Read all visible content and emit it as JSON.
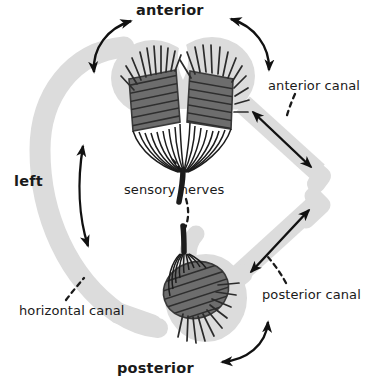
{
  "figure": {
    "background_color": "#ffffff",
    "width": 368,
    "height": 385
  },
  "palette": {
    "canal_fill": "#d9d9d9",
    "canal_fill_light": "#e2e2e2",
    "cupula_dark": "#4a4a4a",
    "hair_line": "#2b2b2b",
    "nerve_line": "#1c1c1c",
    "arrow": "#111111",
    "leader_dash": "#1a1a1a",
    "text": "#1a1a1a"
  },
  "orientation_labels": [
    {
      "id": "anterior",
      "text": "anterior",
      "weight": "bold"
    },
    {
      "id": "posterior",
      "text": "posterior",
      "weight": "bold"
    },
    {
      "id": "left",
      "text": "left",
      "weight": "bold"
    }
  ],
  "structure_labels": [
    {
      "id": "anterior-canal",
      "text": "anterior canal",
      "weight": "normal",
      "has_leader": true
    },
    {
      "id": "posterior-canal",
      "text": "posterior canal",
      "weight": "normal",
      "has_leader": true
    },
    {
      "id": "horizontal-canal",
      "text": "horizontal canal",
      "weight": "normal",
      "has_leader": true
    },
    {
      "id": "sensory-nerves",
      "text": "sensory nerves",
      "weight": "normal",
      "has_leader": true
    }
  ],
  "labels": {
    "anterior": "anterior",
    "posterior": "posterior",
    "left": "left",
    "anterior_canal": "anterior canal",
    "posterior_canal": "posterior canal",
    "horizontal_canal": "horizontal canal",
    "sensory_nerves": "sensory nerves"
  },
  "anatomy": {
    "ampullae": [
      {
        "id": "anterior-left-ampulla",
        "position": "upper-left"
      },
      {
        "id": "anterior-right-ampulla",
        "position": "upper-right"
      },
      {
        "id": "posterior-ampulla",
        "position": "lower-center"
      }
    ],
    "canals": [
      {
        "id": "horizontal-canal-body",
        "shape": "c-arc",
        "side": "left"
      },
      {
        "id": "anterior-canal-body",
        "shape": "diagonal",
        "side": "upper-right"
      },
      {
        "id": "posterior-canal-body",
        "shape": "diagonal",
        "side": "lower-right"
      }
    ],
    "nerve_bundles": [
      {
        "id": "upper-nerve-trunk"
      },
      {
        "id": "lower-nerve-trunk"
      }
    ]
  },
  "arrows": {
    "curved": [
      {
        "id": "arrow-curved-top-left",
        "style": "double-headed"
      },
      {
        "id": "arrow-curved-top-right",
        "style": "double-headed"
      },
      {
        "id": "arrow-curved-bottom",
        "style": "double-headed"
      }
    ],
    "straight": [
      {
        "id": "arrow-horizontal-canal",
        "style": "double-headed"
      },
      {
        "id": "arrow-anterior-canal",
        "style": "double-headed"
      },
      {
        "id": "arrow-posterior-canal",
        "style": "double-headed"
      }
    ]
  }
}
